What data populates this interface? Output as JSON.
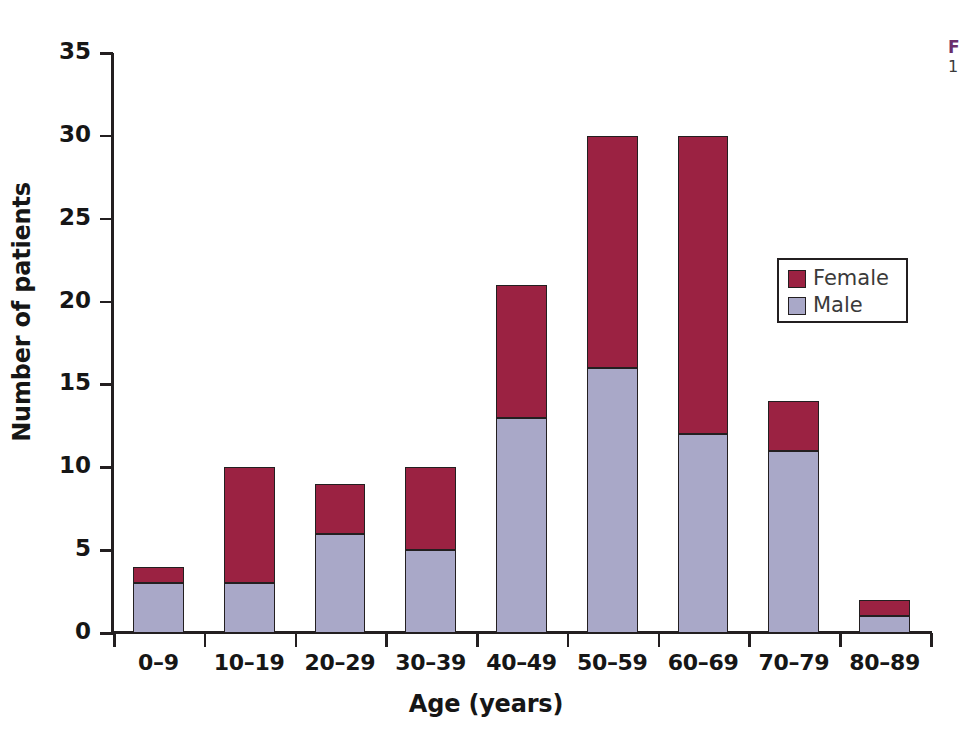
{
  "chart_data": {
    "type": "bar",
    "subtype": "stacked-vertical",
    "title": "",
    "xlabel": "Age (years)",
    "ylabel": "Number of patients",
    "categories": [
      "0–9",
      "10–19",
      "20–29",
      "30–39",
      "40–49",
      "50–59",
      "60–69",
      "70–79",
      "80–89"
    ],
    "series": [
      {
        "name": "Male",
        "color": "#a9a8c8",
        "values": [
          3,
          3,
          6,
          5,
          13,
          16,
          12,
          11,
          1
        ]
      },
      {
        "name": "Female",
        "color": "#9b2242",
        "values": [
          1,
          7,
          3,
          5,
          8,
          14,
          18,
          3,
          1
        ]
      }
    ],
    "totals": [
      4,
      10,
      9,
      10,
      21,
      30,
      30,
      14,
      2
    ],
    "stack_order": [
      "Male",
      "Female"
    ],
    "ylim": [
      0,
      35
    ],
    "yticks": [
      0,
      5,
      10,
      15,
      20,
      25,
      30,
      35
    ],
    "ytick_labels": [
      "0",
      "5",
      "10",
      "15",
      "20",
      "25",
      "30",
      "35"
    ],
    "grid": false,
    "legend_position": "inside-right",
    "legend_entries": [
      {
        "label": "Female",
        "color": "#9b2242"
      },
      {
        "label": "Male",
        "color": "#a9a8c8"
      }
    ]
  },
  "legend": {
    "female_label": "Female",
    "male_label": "Male"
  },
  "axes": {
    "x_title": "Age (years)",
    "y_title": "Number of patients"
  },
  "caption": {
    "label": "F",
    "body": "1"
  },
  "colors": {
    "female": "#9b2242",
    "male": "#a9a8c8",
    "axis": "#231f20",
    "text": "#161616",
    "caption_accent": "#6b2f6b",
    "background": "#ffffff"
  }
}
